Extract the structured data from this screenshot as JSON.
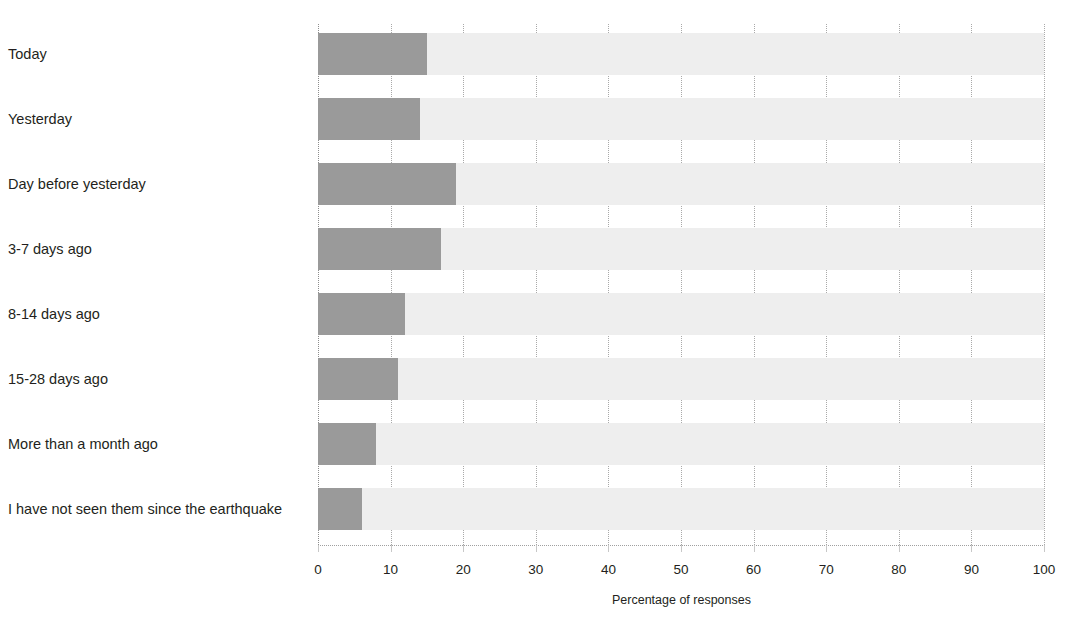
{
  "chart_data": {
    "type": "bar",
    "orientation": "horizontal",
    "title": "",
    "xlabel": "Percentage of responses",
    "ylabel": "",
    "xlim": [
      0,
      100
    ],
    "xticks": [
      0,
      10,
      20,
      30,
      40,
      50,
      60,
      70,
      80,
      90,
      100
    ],
    "xtick_labels": [
      "0",
      "10",
      "20",
      "30",
      "40",
      "50",
      "60",
      "70",
      "80",
      "90",
      "100"
    ],
    "grid": true,
    "grid_axis": "x",
    "grid_style": "dotted",
    "legend": false,
    "categories": [
      "Today",
      "Yesterday",
      "Day before yesterday",
      "3-7 days ago",
      "8-14 days ago",
      "15-28 days ago",
      "More than a month ago",
      "I have not seen them since the earthquake"
    ],
    "values": [
      15,
      14,
      19,
      17,
      12,
      11,
      8,
      6
    ],
    "bar_color": "#9a9a9a",
    "track_color": "#eeeeee",
    "background_color": "#ffffff"
  }
}
